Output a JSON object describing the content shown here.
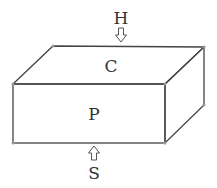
{
  "diagram": {
    "type": "3d-box",
    "labels": {
      "top_arrow": "H",
      "top_face": "C",
      "front_face": "P",
      "bottom_arrow": "S"
    },
    "arrows": [
      {
        "label": "H",
        "direction": "down",
        "target": "top_face"
      },
      {
        "label": "S",
        "direction": "up",
        "target": "bottom_face"
      }
    ]
  }
}
